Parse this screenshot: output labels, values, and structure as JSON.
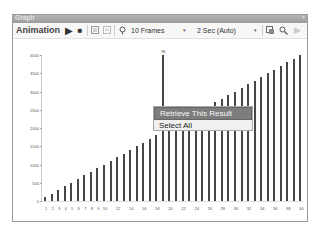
{
  "window": {
    "title": "Graph",
    "close": "×"
  },
  "toolbar": {
    "animation_label": "Animation",
    "play_icon": "▶",
    "stop_icon": "■",
    "frames_value": "10 Frames",
    "speed_value": "2 Sec (Auto)",
    "dropdown_arrow": "▾"
  },
  "context_menu": {
    "items": [
      {
        "label": "Retrieve This Result",
        "highlighted": true
      },
      {
        "label": "Select All",
        "highlighted": false
      }
    ]
  },
  "chart_data": {
    "type": "bar",
    "title": "",
    "xlabel": "",
    "ylabel": "",
    "ylim": [
      0,
      4000
    ],
    "y_ticks": [
      "4000",
      "3500",
      "3000",
      "2500",
      "2000",
      "1500",
      "1000",
      "500",
      "0"
    ],
    "x_tick_labels": [
      "1",
      "2",
      "3",
      "4",
      "5",
      "6",
      "7",
      "8",
      "9",
      "10",
      "12",
      "14",
      "16",
      "18",
      "20",
      "22",
      "24",
      "26",
      "28",
      "30",
      "32",
      "34",
      "36",
      "38",
      "40"
    ],
    "categories": [
      1,
      2,
      3,
      4,
      5,
      6,
      7,
      8,
      9,
      10,
      11,
      12,
      13,
      14,
      15,
      16,
      17,
      18,
      19,
      20,
      21,
      22,
      23,
      24,
      25,
      26,
      27,
      28,
      29,
      30,
      31,
      32,
      33,
      34,
      35,
      36,
      37,
      38,
      39,
      40
    ],
    "values": [
      100,
      200,
      300,
      400,
      500,
      600,
      700,
      800,
      900,
      1000,
      1100,
      1200,
      1300,
      1400,
      1500,
      1600,
      1700,
      1800,
      4000,
      2000,
      2100,
      2200,
      2300,
      2400,
      2500,
      2600,
      2700,
      2800,
      2900,
      3000,
      3100,
      3200,
      3300,
      3400,
      3500,
      3600,
      3700,
      3800,
      3900,
      4000
    ],
    "selected_index": 18,
    "selected_label": "76",
    "bar_color": "#474747",
    "grid": false,
    "legend": "none"
  }
}
